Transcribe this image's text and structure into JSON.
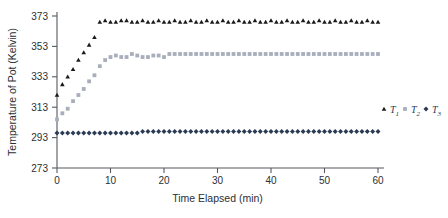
{
  "chart_data": {
    "type": "scatter",
    "title": "",
    "xlabel": "Time Elapsed (min)",
    "ylabel": "Temperature of Pot (Kelvin)",
    "xlim": [
      0,
      60
    ],
    "ylim": [
      273,
      373
    ],
    "xticks": [
      0,
      10,
      20,
      30,
      40,
      50,
      60
    ],
    "yticks": [
      273,
      293,
      313,
      333,
      353,
      373
    ],
    "grid": false,
    "legend_position": "right-middle",
    "x": [
      0,
      1,
      2,
      3,
      4,
      5,
      6,
      7,
      8,
      9,
      10,
      11,
      12,
      13,
      14,
      15,
      16,
      17,
      18,
      19,
      20,
      21,
      22,
      23,
      24,
      25,
      26,
      27,
      28,
      29,
      30,
      31,
      32,
      33,
      34,
      35,
      36,
      37,
      38,
      39,
      40,
      41,
      42,
      43,
      44,
      45,
      46,
      47,
      48,
      49,
      50,
      51,
      52,
      53,
      54,
      55,
      56,
      57,
      58,
      59,
      60
    ],
    "series": [
      {
        "name": "T1",
        "marker": "triangle",
        "color": "#1a1a1a",
        "values": [
          321,
          328,
          333,
          338,
          344,
          349,
          354,
          359,
          369,
          370,
          369,
          369,
          370,
          370,
          369,
          369,
          370,
          369,
          369,
          370,
          369,
          369,
          370,
          369,
          369,
          370,
          369,
          369,
          370,
          369,
          369,
          370,
          369,
          369,
          370,
          369,
          369,
          370,
          369,
          369,
          370,
          369,
          369,
          370,
          369,
          369,
          370,
          369,
          369,
          370,
          369,
          369,
          370,
          369,
          369,
          370,
          369,
          369,
          370,
          369,
          369
        ]
      },
      {
        "name": "T2",
        "marker": "square",
        "color": "#a8aebb",
        "values": [
          305,
          309,
          312,
          317,
          321,
          325,
          330,
          334,
          340,
          344,
          346,
          347,
          346,
          346,
          348,
          347,
          346,
          346,
          347,
          347,
          346,
          348,
          348,
          348,
          348,
          348,
          348,
          348,
          348,
          348,
          348,
          348,
          348,
          348,
          348,
          348,
          348,
          348,
          348,
          348,
          348,
          348,
          348,
          348,
          348,
          348,
          348,
          348,
          348,
          348,
          348,
          348,
          348,
          348,
          348,
          348,
          348,
          348,
          348,
          348,
          348
        ]
      },
      {
        "name": "T3",
        "marker": "diamond",
        "color": "#2b3a55",
        "values": [
          296,
          296,
          296,
          296,
          296,
          296,
          296,
          296,
          296,
          296,
          296,
          296,
          296,
          296,
          296,
          296,
          297,
          297,
          297,
          297,
          297,
          297,
          297,
          297,
          297,
          297,
          297,
          297,
          297,
          297,
          297,
          297,
          297,
          297,
          297,
          297,
          297,
          297,
          297,
          297,
          297,
          297,
          297,
          297,
          297,
          297,
          297,
          297,
          297,
          297,
          297,
          297,
          297,
          297,
          297,
          297,
          297,
          297,
          297,
          297,
          297
        ]
      }
    ],
    "legend": [
      {
        "label": "T",
        "sub": "1",
        "marker": "triangle",
        "color": "#1a1a1a"
      },
      {
        "label": "T",
        "sub": "2",
        "marker": "square",
        "color": "#a8aebb"
      },
      {
        "label": "T",
        "sub": "3",
        "marker": "diamond",
        "color": "#2b3a55"
      }
    ]
  }
}
